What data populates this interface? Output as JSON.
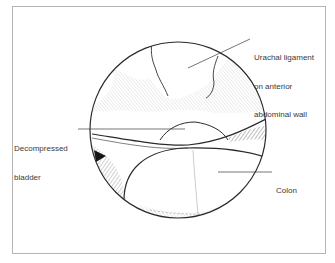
{
  "figure": {
    "type": "medical-illustration",
    "view": "circular laparoscopic view",
    "labels": [
      {
        "id": "urachal",
        "lines": [
          "Urachal ligament",
          "on anterior",
          "abdominal wall"
        ]
      },
      {
        "id": "bladder",
        "lines": [
          "Decompressed",
          "bladder"
        ]
      },
      {
        "id": "colon",
        "lines": [
          "Colon"
        ]
      }
    ],
    "colors": {
      "ink": "#2a2a2a",
      "frame": "#b5b5b5",
      "background": "#ffffff"
    }
  }
}
